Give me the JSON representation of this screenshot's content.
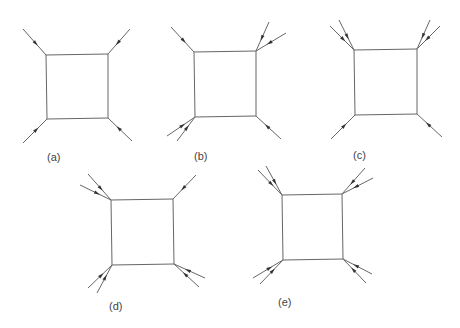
{
  "colors": {
    "line": "#666666",
    "arrow": "#333333"
  },
  "diagrams": [
    {
      "id": "a",
      "label": "(a)",
      "label_pos": [
        47,
        151
      ],
      "square": [
        [
          46,
          55
        ],
        [
          108,
          54
        ],
        [
          108,
          118
        ],
        [
          47,
          119
        ]
      ],
      "legs": [
        {
          "from": [
            23,
            29
          ],
          "to": [
            46,
            55
          ]
        },
        {
          "from": [
            130,
            29
          ],
          "to": [
            108,
            54
          ]
        },
        {
          "from": [
            23,
            143
          ],
          "to": [
            47,
            119
          ]
        },
        {
          "from": [
            132,
            141
          ],
          "to": [
            108,
            118
          ]
        }
      ]
    },
    {
      "id": "b",
      "label": "(b)",
      "label_pos": [
        194,
        150
      ],
      "square": [
        [
          194,
          52
        ],
        [
          256,
          51
        ],
        [
          256,
          116
        ],
        [
          195,
          117
        ]
      ],
      "legs": [
        {
          "from": [
            171,
            27
          ],
          "to": [
            194,
            52
          ]
        },
        {
          "from": [
            269,
            22
          ],
          "to": [
            256,
            51
          ]
        },
        {
          "from": [
            286,
            33
          ],
          "to": [
            256,
            51
          ]
        },
        {
          "from": [
            167,
            136
          ],
          "to": [
            195,
            117
          ]
        },
        {
          "from": [
            177,
            141
          ],
          "to": [
            195,
            117
          ]
        },
        {
          "from": [
            281,
            139
          ],
          "to": [
            256,
            116
          ]
        }
      ]
    },
    {
      "id": "c",
      "label": "(c)",
      "label_pos": [
        353,
        149
      ],
      "square": [
        [
          354,
          50
        ],
        [
          417,
          49
        ],
        [
          417,
          114
        ],
        [
          355,
          115
        ]
      ],
      "legs": [
        {
          "from": [
            330,
            26
          ],
          "to": [
            354,
            50
          ]
        },
        {
          "from": [
            339,
            20
          ],
          "to": [
            354,
            50
          ]
        },
        {
          "from": [
            430,
            20
          ],
          "to": [
            417,
            49
          ]
        },
        {
          "from": [
            440,
            26
          ],
          "to": [
            417,
            49
          ]
        },
        {
          "from": [
            331,
            139
          ],
          "to": [
            355,
            115
          ]
        },
        {
          "from": [
            442,
            137
          ],
          "to": [
            417,
            114
          ]
        }
      ]
    },
    {
      "id": "d",
      "label": "(d)",
      "label_pos": [
        109,
        300
      ],
      "square": [
        [
          111,
          200
        ],
        [
          173,
          199
        ],
        [
          174,
          264
        ],
        [
          112,
          265
        ]
      ],
      "legs": [
        {
          "from": [
            88,
            174
          ],
          "to": [
            111,
            200
          ]
        },
        {
          "from": [
            80,
            185
          ],
          "to": [
            111,
            200
          ]
        },
        {
          "from": [
            196,
            175
          ],
          "to": [
            173,
            199
          ]
        },
        {
          "from": [
            88,
            288
          ],
          "to": [
            112,
            265
          ]
        },
        {
          "from": [
            97,
            293
          ],
          "to": [
            112,
            265
          ]
        },
        {
          "from": [
            205,
            278
          ],
          "to": [
            174,
            264
          ]
        },
        {
          "from": [
            199,
            287
          ],
          "to": [
            174,
            264
          ]
        }
      ]
    },
    {
      "id": "e",
      "label": "(e)",
      "label_pos": [
        278,
        296
      ],
      "square": [
        [
          282,
          195
        ],
        [
          342,
          194
        ],
        [
          343,
          259
        ],
        [
          283,
          260
        ]
      ],
      "legs": [
        {
          "from": [
            258,
            170
          ],
          "to": [
            282,
            195
          ]
        },
        {
          "from": [
            266,
            166
          ],
          "to": [
            282,
            195
          ]
        },
        {
          "from": [
            365,
            168
          ],
          "to": [
            342,
            194
          ]
        },
        {
          "from": [
            373,
            178
          ],
          "to": [
            342,
            194
          ]
        },
        {
          "from": [
            253,
            278
          ],
          "to": [
            283,
            260
          ]
        },
        {
          "from": [
            260,
            284
          ],
          "to": [
            283,
            260
          ]
        },
        {
          "from": [
            372,
            274
          ],
          "to": [
            343,
            259
          ]
        },
        {
          "from": [
            366,
            283
          ],
          "to": [
            343,
            259
          ]
        }
      ]
    }
  ]
}
